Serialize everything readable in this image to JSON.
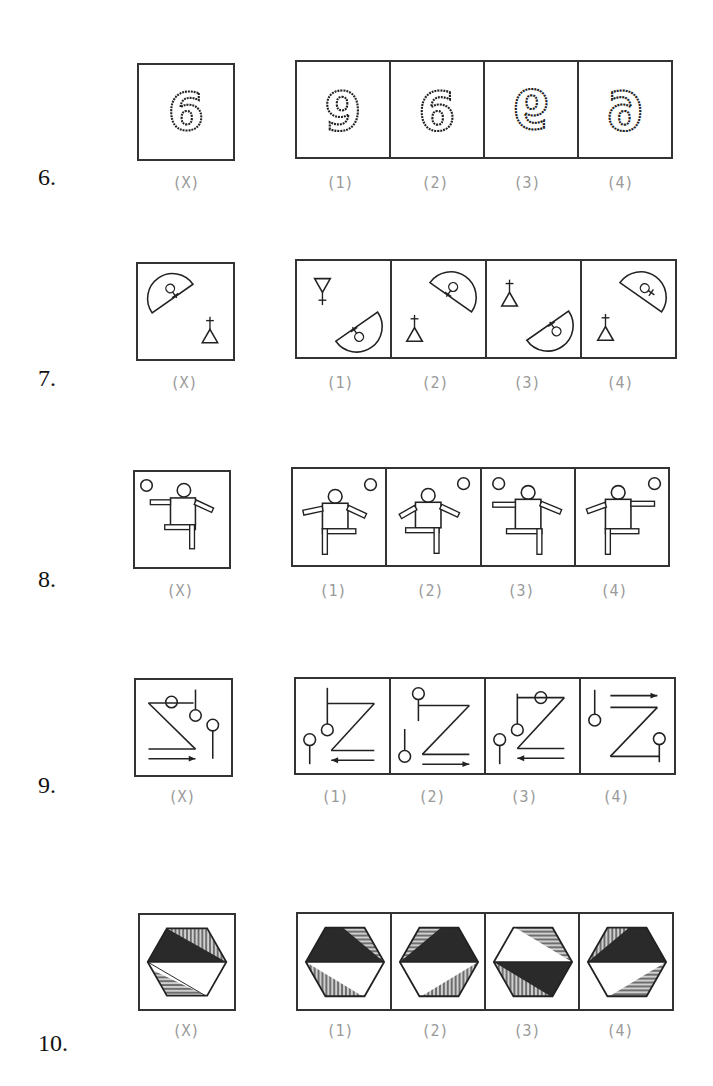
{
  "questions": [
    {
      "number": "6.",
      "figure_type": "digit-6-beaded",
      "problem_label": "(X)",
      "options": [
        {
          "label": "(1)",
          "glyph": "9"
        },
        {
          "label": "(2)",
          "glyph": "mirrored-6-rotated"
        },
        {
          "label": "(3)",
          "glyph": "flipped-6"
        },
        {
          "label": "(4)",
          "glyph": "mirrored-6"
        }
      ],
      "problem_glyph": "6"
    },
    {
      "number": "7.",
      "figure_type": "semicircle-venus-triangle-cross",
      "problem_label": "(X)",
      "options": [
        {
          "label": "(1)"
        },
        {
          "label": "(2)"
        },
        {
          "label": "(3)"
        },
        {
          "label": "(4)"
        }
      ]
    },
    {
      "number": "8.",
      "figure_type": "stick-figure-ball",
      "problem_label": "(X)",
      "options": [
        {
          "label": "(1)"
        },
        {
          "label": "(2)"
        },
        {
          "label": "(3)"
        },
        {
          "label": "(4)"
        }
      ]
    },
    {
      "number": "9.",
      "figure_type": "z-shape-pins-arrows",
      "problem_label": "(X)",
      "options": [
        {
          "label": "(1)"
        },
        {
          "label": "(2)"
        },
        {
          "label": "(3)"
        },
        {
          "label": "(4)"
        }
      ]
    },
    {
      "number": "10.",
      "figure_type": "shaded-hexagon",
      "problem_label": "(X)",
      "options": [
        {
          "label": "(1)"
        },
        {
          "label": "(2)"
        },
        {
          "label": "(3)"
        },
        {
          "label": "(4)"
        }
      ]
    }
  ],
  "colors": {
    "line": "#333333",
    "label_gray": "#9a9a9a",
    "dark_fill": "#2a2a2a",
    "hatch_fill": "#777777"
  }
}
